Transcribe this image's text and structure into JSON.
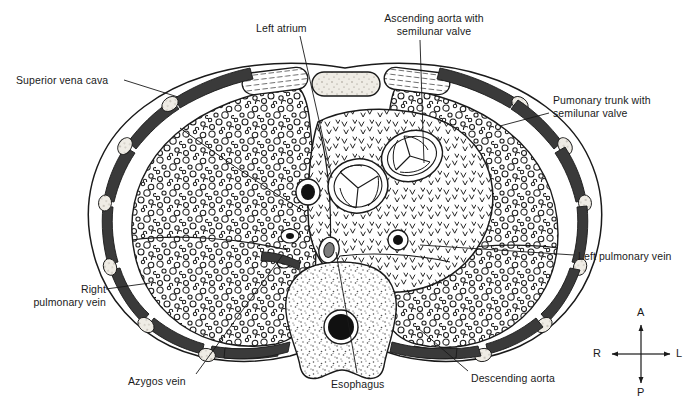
{
  "figure": {
    "view": "axial cross-section",
    "background_color": "#ffffff",
    "ink_color": "#1a1a1a",
    "rib_color": "#3a3a3a",
    "cartilage_color": "#d9d5cc"
  },
  "labels": [
    {
      "id": "superior-vena-cava",
      "text": "Superior vena cava",
      "align": "left",
      "x": 16,
      "y": 74,
      "leader": {
        "x1": 124,
        "y1": 80,
        "x2": 178,
        "y2": 97
      }
    },
    {
      "id": "left-atrium",
      "text": "Left atrium",
      "align": "left",
      "x": 256,
      "y": 22,
      "leader": {
        "x1": 300,
        "y1": 36,
        "x2": 332,
        "y2": 178
      }
    },
    {
      "id": "ascending-aorta",
      "text": "Ascending aorta with\nsemilunar valve",
      "align": "center",
      "x": 364,
      "y": 12,
      "leader": {
        "x1": 420,
        "y1": 40,
        "x2": 424,
        "y2": 163
      }
    },
    {
      "id": "pulmonary-trunk",
      "text": "Pumonary trunk with\nsemilunar valve",
      "align": "left",
      "x": 553,
      "y": 94,
      "leader": {
        "x1": 549,
        "y1": 113,
        "x2": 500,
        "y2": 126
      }
    },
    {
      "id": "left-pulmonary-vein",
      "text": "Left pulmonary vein",
      "align": "left",
      "x": 578,
      "y": 250,
      "leader": {
        "x1": 574,
        "y1": 255,
        "x2": 420,
        "y2": 245
      }
    },
    {
      "id": "right-pulmonary-vein",
      "text": "Right\npulmonary vein",
      "align": "right",
      "x": 14,
      "y": 283,
      "leader": {
        "x1": 106,
        "y1": 289,
        "x2": 150,
        "y2": 283
      }
    },
    {
      "id": "azygos-vein",
      "text": "Azygos vein",
      "align": "left",
      "x": 128,
      "y": 375,
      "leader": {
        "x1": 196,
        "y1": 374,
        "x2": 282,
        "y2": 256
      }
    },
    {
      "id": "esophagus",
      "text": "Esophagus",
      "align": "left",
      "x": 331,
      "y": 378,
      "leader": {
        "x1": 357,
        "y1": 373,
        "x2": 336,
        "y2": 252
      }
    },
    {
      "id": "descending-aorta",
      "text": "Descending aorta",
      "align": "left",
      "x": 471,
      "y": 372,
      "leader": {
        "x1": 468,
        "y1": 371,
        "x2": 418,
        "y2": 328
      }
    }
  ],
  "compass": {
    "name": "orientation-compass",
    "center": {
      "x": 641,
      "y": 354
    },
    "anterior": "A",
    "posterior": "P",
    "right": "R",
    "left": "L"
  },
  "structures": [
    {
      "id": "body-wall",
      "name": "Thoracic body wall"
    },
    {
      "id": "right-lung",
      "name": "Right lung"
    },
    {
      "id": "left-lung",
      "name": "Left lung"
    },
    {
      "id": "mediastinum",
      "name": "Mediastinum / heart"
    },
    {
      "id": "sternum",
      "name": "Sternum"
    },
    {
      "id": "costal-cartilage",
      "name": "Costal cartilage"
    },
    {
      "id": "vertebral-body",
      "name": "Vertebral body"
    },
    {
      "id": "spinal-cord",
      "name": "Spinal cord"
    },
    {
      "id": "aortic-valve",
      "name": "Aortic semilunar valve"
    },
    {
      "id": "pulmonary-valve",
      "name": "Pulmonary semilunar valve"
    },
    {
      "id": "ribs",
      "name": "Ribs"
    }
  ]
}
